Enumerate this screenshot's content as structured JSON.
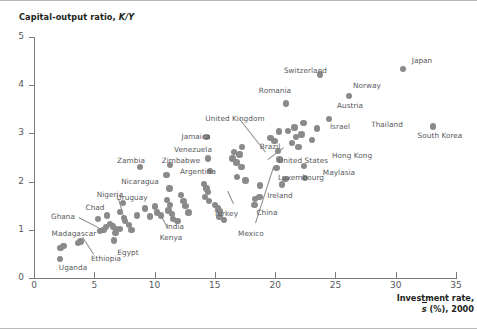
{
  "figure": {
    "y_axis_title_text": "Capital-output ratio, ",
    "y_axis_title_italic": "K/Y",
    "x_axis_title_line1": "Investment rate,",
    "x_axis_title_sbar": "s",
    "x_axis_title_rest": " (%), 2000",
    "dot_color": "#8a8a8a",
    "text_color": "#58595b",
    "title_color": "#231f20",
    "axis_color": "#7b7b7b"
  },
  "chart_data": {
    "type": "scatter",
    "title": "",
    "xlabel": "Investment rate, s̄ (%), 2000",
    "ylabel": "Capital-output ratio, K/Y",
    "xlim": [
      0,
      35
    ],
    "ylim": [
      0,
      5
    ],
    "xticks": [
      0,
      5,
      10,
      15,
      20,
      25,
      30,
      35
    ],
    "yticks": [
      0,
      1,
      2,
      3,
      4,
      5
    ],
    "grid": false,
    "legend": false,
    "points": [
      {
        "label": "Uganda",
        "x": 2.15,
        "y": 0.4
      },
      {
        "label": "Madagascar",
        "x": 2.2,
        "y": 0.62
      },
      {
        "label": "",
        "x": 2.45,
        "y": 0.66
      },
      {
        "label": "Ethiopia",
        "x": 3.65,
        "y": 0.72
      },
      {
        "label": "",
        "x": 3.85,
        "y": 0.76
      },
      {
        "label": "Ghana",
        "x": 5.45,
        "y": 0.98
      },
      {
        "label": "",
        "x": 5.75,
        "y": 1.0
      },
      {
        "label": "",
        "x": 5.95,
        "y": 1.06
      },
      {
        "label": "",
        "x": 5.3,
        "y": 1.22
      },
      {
        "label": "Chad",
        "x": 6.05,
        "y": 1.3
      },
      {
        "label": "",
        "x": 6.3,
        "y": 1.12
      },
      {
        "label": "",
        "x": 6.55,
        "y": 1.07
      },
      {
        "label": "",
        "x": 6.8,
        "y": 1.02
      },
      {
        "label": "",
        "x": 6.75,
        "y": 0.94
      },
      {
        "label": "Egypt",
        "x": 6.65,
        "y": 0.78
      },
      {
        "label": "",
        "x": 7.15,
        "y": 1.02
      },
      {
        "label": "Nigeria",
        "x": 7.4,
        "y": 1.56
      },
      {
        "label": "",
        "x": 7.15,
        "y": 1.37
      },
      {
        "label": "",
        "x": 7.45,
        "y": 1.25
      },
      {
        "label": "Kenya",
        "x": 7.55,
        "y": 1.18
      },
      {
        "label": "",
        "x": 7.9,
        "y": 1.1
      },
      {
        "label": "",
        "x": 8.1,
        "y": 1.0
      },
      {
        "label": "",
        "x": 8.55,
        "y": 1.3
      },
      {
        "label": "Zambia",
        "x": 8.8,
        "y": 2.3
      },
      {
        "label": "",
        "x": 9.2,
        "y": 1.44
      },
      {
        "label": "",
        "x": 9.6,
        "y": 1.28
      },
      {
        "label": "",
        "x": 10.05,
        "y": 1.48
      },
      {
        "label": "",
        "x": 10.2,
        "y": 1.36
      },
      {
        "label": "",
        "x": 10.55,
        "y": 1.3
      },
      {
        "label": "Nicaragua",
        "x": 11.0,
        "y": 2.14
      },
      {
        "label": "Uruguay",
        "x": 11.25,
        "y": 1.86
      },
      {
        "label": "Zimbabwe",
        "x": 11.3,
        "y": 2.35
      },
      {
        "label": "",
        "x": 11.05,
        "y": 1.62
      },
      {
        "label": "",
        "x": 11.3,
        "y": 1.52
      },
      {
        "label": "",
        "x": 11.15,
        "y": 1.4
      },
      {
        "label": "",
        "x": 11.45,
        "y": 1.33
      },
      {
        "label": "India",
        "x": 11.55,
        "y": 1.22
      },
      {
        "label": "",
        "x": 11.9,
        "y": 1.18
      },
      {
        "label": "",
        "x": 12.2,
        "y": 1.72
      },
      {
        "label": "",
        "x": 12.4,
        "y": 1.6
      },
      {
        "label": "",
        "x": 12.55,
        "y": 1.5
      },
      {
        "label": "",
        "x": 12.8,
        "y": 1.36
      },
      {
        "label": "Jamaica",
        "x": 14.3,
        "y": 2.92
      },
      {
        "label": "Venezuela",
        "x": 14.45,
        "y": 2.48
      },
      {
        "label": "Argentina",
        "x": 14.6,
        "y": 2.22
      },
      {
        "label": "",
        "x": 14.1,
        "y": 1.95
      },
      {
        "label": "",
        "x": 14.3,
        "y": 1.86
      },
      {
        "label": "",
        "x": 14.45,
        "y": 1.78
      },
      {
        "label": "",
        "x": 14.2,
        "y": 1.68
      },
      {
        "label": "",
        "x": 14.5,
        "y": 1.6
      },
      {
        "label": "Turkey",
        "x": 15.0,
        "y": 1.52
      },
      {
        "label": "",
        "x": 15.25,
        "y": 1.44
      },
      {
        "label": "",
        "x": 15.45,
        "y": 1.38
      },
      {
        "label": "",
        "x": 15.4,
        "y": 1.26
      },
      {
        "label": "",
        "x": 15.75,
        "y": 1.2
      },
      {
        "label": "United Kingdom",
        "x": 16.6,
        "y": 2.62
      },
      {
        "label": "",
        "x": 16.45,
        "y": 2.48
      },
      {
        "label": "",
        "x": 16.8,
        "y": 2.4
      },
      {
        "label": "",
        "x": 17.05,
        "y": 2.56
      },
      {
        "label": "Brazil",
        "x": 17.25,
        "y": 2.72
      },
      {
        "label": "",
        "x": 17.2,
        "y": 2.3
      },
      {
        "label": "Mexico",
        "x": 16.85,
        "y": 2.1
      },
      {
        "label": "",
        "x": 17.55,
        "y": 2.02
      },
      {
        "label": "China",
        "x": 18.3,
        "y": 1.52
      },
      {
        "label": "Ireland",
        "x": 18.7,
        "y": 1.68
      },
      {
        "label": "",
        "x": 18.35,
        "y": 1.64
      },
      {
        "label": "",
        "x": 18.75,
        "y": 1.92
      },
      {
        "label": "",
        "x": 19.6,
        "y": 2.9
      },
      {
        "label": "",
        "x": 19.95,
        "y": 2.84
      },
      {
        "label": "",
        "x": 20.3,
        "y": 3.04
      },
      {
        "label": "",
        "x": 20.25,
        "y": 2.64
      },
      {
        "label": "United States",
        "x": 20.1,
        "y": 2.28
      },
      {
        "label": "",
        "x": 20.35,
        "y": 2.46
      },
      {
        "label": "Romania",
        "x": 20.9,
        "y": 3.62
      },
      {
        "label": "",
        "x": 20.55,
        "y": 1.94
      },
      {
        "label": "Luxembourg",
        "x": 20.85,
        "y": 2.05
      },
      {
        "label": "",
        "x": 21.05,
        "y": 3.05
      },
      {
        "label": "",
        "x": 21.4,
        "y": 2.8
      },
      {
        "label": "",
        "x": 21.6,
        "y": 3.12
      },
      {
        "label": "",
        "x": 21.75,
        "y": 2.92
      },
      {
        "label": "",
        "x": 21.95,
        "y": 2.72
      },
      {
        "label": "Austria",
        "x": 22.35,
        "y": 3.22
      },
      {
        "label": "",
        "x": 22.2,
        "y": 2.98
      },
      {
        "label": "Hong Kong",
        "x": 22.4,
        "y": 2.32
      },
      {
        "label": "Maylasia",
        "x": 22.5,
        "y": 2.08
      },
      {
        "label": "Israel",
        "x": 23.05,
        "y": 2.86
      },
      {
        "label": "",
        "x": 23.45,
        "y": 3.1
      },
      {
        "label": "Switzerland",
        "x": 23.7,
        "y": 4.22
      },
      {
        "label": "Thailand",
        "x": 24.45,
        "y": 3.3
      },
      {
        "label": "Norway",
        "x": 26.15,
        "y": 3.78
      },
      {
        "label": "Japan",
        "x": 30.6,
        "y": 4.34
      },
      {
        "label": "South Korea",
        "x": 33.1,
        "y": 3.14
      }
    ],
    "labels_placed": [
      {
        "text": "Uganda",
        "x": 73,
        "y": 262,
        "align": "c"
      },
      {
        "text": "Madagascar",
        "x": 74,
        "y": 228,
        "align": "c"
      },
      {
        "text": "Ethiopia",
        "x": 106,
        "y": 253,
        "align": "c"
      },
      {
        "text": "Ghana",
        "x": 63,
        "y": 211,
        "align": "c"
      },
      {
        "text": "Chad",
        "x": 95,
        "y": 202,
        "align": "c"
      },
      {
        "text": "Egypt",
        "x": 128,
        "y": 247,
        "align": "c"
      },
      {
        "text": "Nigeria",
        "x": 110,
        "y": 189,
        "align": "c"
      },
      {
        "text": "Kenya",
        "x": 171,
        "y": 232,
        "align": "c"
      },
      {
        "text": "Zambia",
        "x": 131,
        "y": 155,
        "align": "c"
      },
      {
        "text": "Nicaragua",
        "x": 140,
        "y": 176,
        "align": "c"
      },
      {
        "text": "Uruguay",
        "x": 132,
        "y": 192,
        "align": "c"
      },
      {
        "text": "Zimbabwe",
        "x": 181,
        "y": 155,
        "align": "c"
      },
      {
        "text": "India",
        "x": 175,
        "y": 221,
        "align": "c"
      },
      {
        "text": "Jamaica",
        "x": 196,
        "y": 131,
        "align": "c"
      },
      {
        "text": "Venezuela",
        "x": 193,
        "y": 144,
        "align": "c"
      },
      {
        "text": "Argentina",
        "x": 198,
        "y": 166,
        "align": "c"
      },
      {
        "text": "Turkey",
        "x": 226,
        "y": 208,
        "align": "c"
      },
      {
        "text": "United Kingdom",
        "x": 235,
        "y": 113,
        "align": "c"
      },
      {
        "text": "Brazil",
        "x": 270,
        "y": 141,
        "align": "c"
      },
      {
        "text": "Mexico",
        "x": 251,
        "y": 228,
        "align": "c"
      },
      {
        "text": "China",
        "x": 267,
        "y": 207,
        "align": "c"
      },
      {
        "text": "Ireland",
        "x": 280,
        "y": 190,
        "align": "c"
      },
      {
        "text": "United States",
        "x": 303,
        "y": 155,
        "align": "c"
      },
      {
        "text": "Luxembourg",
        "x": 301,
        "y": 172,
        "align": "c"
      },
      {
        "text": "Romania",
        "x": 275,
        "y": 85,
        "align": "c"
      },
      {
        "text": "Austria",
        "x": 350,
        "y": 100,
        "align": "c"
      },
      {
        "text": "Israel",
        "x": 340,
        "y": 121,
        "align": "c"
      },
      {
        "text": "Hong Kong",
        "x": 352,
        "y": 150,
        "align": "c"
      },
      {
        "text": "Maylasia",
        "x": 339,
        "y": 167,
        "align": "c"
      },
      {
        "text": "Switzerland",
        "x": 327,
        "y": 65,
        "align": "r"
      },
      {
        "text": "Thailand",
        "x": 387,
        "y": 119,
        "align": "c"
      },
      {
        "text": "Norway",
        "x": 367,
        "y": 80,
        "align": "c"
      },
      {
        "text": "Japan",
        "x": 422,
        "y": 55,
        "align": "c"
      },
      {
        "text": "South Korea",
        "x": 440,
        "y": 130,
        "align": "c"
      }
    ],
    "leader_lines": [
      {
        "x1": 83,
        "y1": 236,
        "x2": 94,
        "y2": 253
      },
      {
        "x1": 79,
        "y1": 216,
        "x2": 100,
        "y2": 227
      },
      {
        "x1": 119,
        "y1": 198,
        "x2": 124,
        "y2": 215
      },
      {
        "x1": 167,
        "y1": 227,
        "x2": 157,
        "y2": 208
      },
      {
        "x1": 240,
        "y1": 118,
        "x2": 266,
        "y2": 151
      },
      {
        "x1": 284,
        "y1": 147,
        "x2": 268,
        "y2": 159
      },
      {
        "x1": 255,
        "y1": 222,
        "x2": 273,
        "y2": 166
      },
      {
        "x1": 233,
        "y1": 203,
        "x2": 227,
        "y2": 190
      }
    ]
  }
}
